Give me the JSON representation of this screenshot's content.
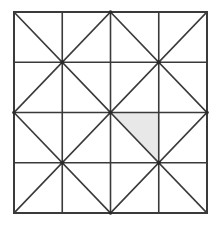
{
  "figure": {
    "title": "Square divided into 4 by 4 grid with block diagonals and one shaded triangle",
    "canvas": {
      "width": 221,
      "height": 226,
      "background_color": "#ffffff"
    },
    "square": {
      "name": "outer-square",
      "x": 14,
      "y": 12,
      "width": 193,
      "height": 201,
      "stroke_color": "#3a3a3a",
      "fill_color": "#ffffff",
      "stroke_width": 2
    },
    "grid": {
      "columns": 4,
      "rows": 4,
      "cell_width": 48.25,
      "cell_height": 50.25,
      "line_color": "#3a3a3a",
      "line_width": 1.6,
      "vertical_line_x": [
        14,
        62.25,
        110.5,
        158.75,
        207
      ],
      "horizontal_line_y": [
        12,
        62.25,
        112.5,
        162.75,
        213
      ]
    },
    "diagonal_blocks": {
      "description": "Each 2 by 2 block of cells contains both diagonals forming an X",
      "block_count": 4,
      "line_color": "#3a3a3a",
      "line_width": 1.6,
      "blocks": [
        {
          "name": "block-top-left",
          "col": 0,
          "row": 0
        },
        {
          "name": "block-top-right",
          "col": 1,
          "row": 0
        },
        {
          "name": "block-bottom-left",
          "col": 0,
          "row": 1
        },
        {
          "name": "block-bottom-right",
          "col": 1,
          "row": 1
        }
      ]
    },
    "shaded_triangle": {
      "name": "shaded-triangle",
      "fill_color": "#e8e8e8",
      "cell_column": 2,
      "cell_row": 2,
      "position": "upper-right half of cell",
      "vertices": [
        {
          "x": 110.5,
          "y": 112.5
        },
        {
          "x": 158.75,
          "y": 112.5
        },
        {
          "x": 158.75,
          "y": 162.75
        }
      ],
      "area_fraction_of_square": 0.03125
    },
    "nodes": {
      "description": "Diagonal intersection points at block centers and block corners",
      "color": "#2a2a2a",
      "radius": 2,
      "points": [
        {
          "x": 62.25,
          "y": 62.25
        },
        {
          "x": 158.75,
          "y": 62.25
        },
        {
          "x": 110.5,
          "y": 112.5
        },
        {
          "x": 62.25,
          "y": 162.75
        },
        {
          "x": 158.75,
          "y": 162.75
        },
        {
          "x": 110.5,
          "y": 12
        },
        {
          "x": 110.5,
          "y": 213
        },
        {
          "x": 14,
          "y": 112.5
        },
        {
          "x": 207,
          "y": 112.5
        }
      ]
    }
  }
}
